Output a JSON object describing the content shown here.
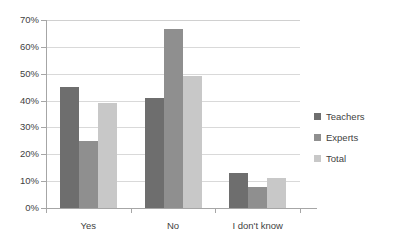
{
  "chart_data": {
    "type": "bar",
    "title": "",
    "subtitle": "",
    "xlabel": "",
    "ylabel": "",
    "categories": [
      "Yes",
      "No",
      "I don't know"
    ],
    "series": [
      {
        "name": "Teachers",
        "color": "#6e6e6e",
        "values": [
          45,
          41,
          13
        ]
      },
      {
        "name": "Experts",
        "color": "#8f8f8f",
        "values": [
          25,
          66.5,
          8
        ]
      },
      {
        "name": "Total",
        "color": "#c8c8c8",
        "values": [
          39,
          49,
          11
        ]
      }
    ],
    "ylim": [
      0,
      70
    ],
    "ytick_step": 10,
    "ytick_labels": [
      "0%",
      "10%",
      "20%",
      "30%",
      "40%",
      "50%",
      "60%",
      "70%"
    ],
    "ytick_values": [
      0,
      10,
      20,
      30,
      40,
      50,
      60,
      70
    ],
    "grid": true,
    "grid_axis": "y",
    "legend_position": "right",
    "value_suffix": "%",
    "background": "#ffffff",
    "axis_color": "#a6a6a6",
    "grid_color": "#d9d9d9",
    "text_color": "#3f3f3f"
  }
}
